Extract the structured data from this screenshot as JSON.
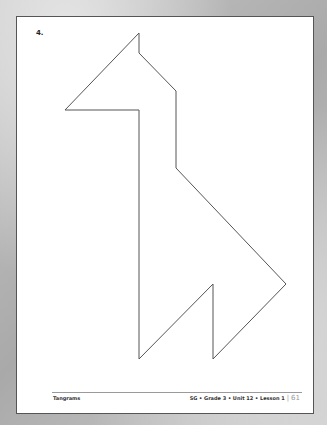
{
  "page": {
    "problem_number": "4.",
    "shape": {
      "name": "tangram-giraffe-outline",
      "stroke": "#555555",
      "points": [
        [
          139,
          33
        ],
        [
          139,
          53
        ],
        [
          176,
          91
        ],
        [
          176,
          168
        ],
        [
          286,
          284
        ],
        [
          213,
          359
        ],
        [
          213,
          284
        ],
        [
          139,
          359
        ],
        [
          139,
          110
        ],
        [
          65,
          110
        ]
      ]
    },
    "footer": {
      "left": "Tangrams",
      "right": "SG • Grade 3 • Unit 12 • Lesson 1",
      "separator": "|",
      "page_number": "61"
    }
  }
}
